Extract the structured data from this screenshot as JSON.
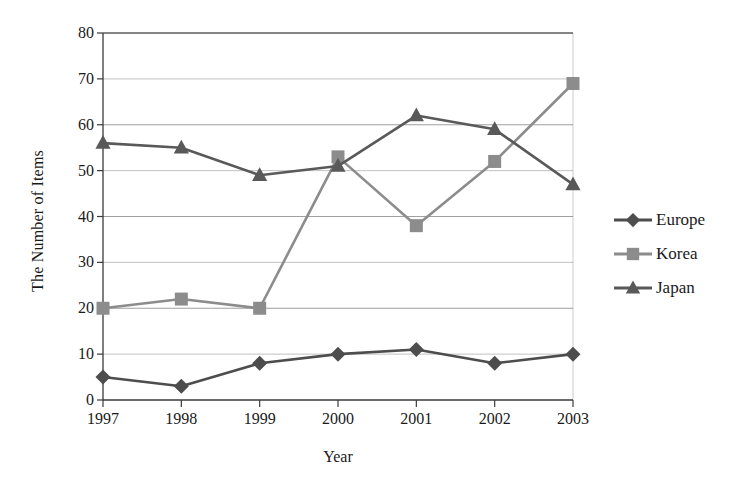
{
  "chart_data": {
    "type": "line",
    "title": "",
    "xlabel": "Year",
    "ylabel": "The Number of Items",
    "categories": [
      "1997",
      "1998",
      "1999",
      "2000",
      "2001",
      "2002",
      "2003"
    ],
    "x": [
      1997,
      1998,
      1999,
      2000,
      2001,
      2002,
      2003
    ],
    "xlim": [
      1997,
      2003
    ],
    "ylim": [
      0,
      80
    ],
    "y_ticks": [
      0,
      10,
      20,
      30,
      40,
      50,
      60,
      70,
      80
    ],
    "y_tick_labels": [
      "0",
      "10",
      "20",
      "30",
      "40",
      "50",
      "60",
      "70",
      "80"
    ],
    "grid": "horizontal",
    "legend_position": "right",
    "series": [
      {
        "name": "Europe",
        "marker": "diamond",
        "color": "#4d4d4d",
        "values": [
          5,
          3,
          8,
          10,
          11,
          8,
          10
        ]
      },
      {
        "name": "Korea",
        "marker": "square",
        "color": "#8c8c8c",
        "values": [
          20,
          22,
          20,
          53,
          38,
          52,
          69
        ]
      },
      {
        "name": "Japan",
        "marker": "triangle",
        "color": "#595959",
        "values": [
          56,
          55,
          49,
          51,
          62,
          59,
          47
        ]
      }
    ]
  },
  "axes": {
    "y_title": "The Number of Items",
    "x_title": "Year"
  },
  "legend": {
    "items": [
      {
        "label": "Europe",
        "marker": "diamond",
        "color": "#4d4d4d"
      },
      {
        "label": "Korea",
        "marker": "square",
        "color": "#8c8c8c"
      },
      {
        "label": "Japan",
        "marker": "triangle",
        "color": "#595959"
      }
    ]
  },
  "colors": {
    "europe": "#4d4d4d",
    "korea": "#8c8c8c",
    "japan": "#595959",
    "axis": "#3a3a3a",
    "grid": "#8f8f8f",
    "background": "#ffffff"
  }
}
